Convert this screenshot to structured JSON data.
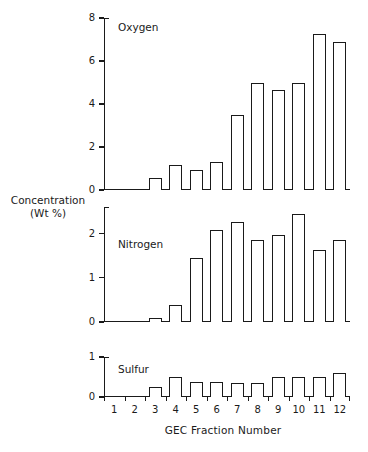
{
  "chart_data": {
    "type": "bar",
    "title": "",
    "xlabel": "GEC Fraction Number",
    "ylabel": "Concentration (Wt %)",
    "ylabel_lines": [
      "Concentration",
      "(Wt %)"
    ],
    "categories": [
      "1",
      "2",
      "3",
      "4",
      "5",
      "6",
      "7",
      "8",
      "9",
      "10",
      "11",
      "12"
    ],
    "grid": false,
    "legend": "none",
    "panels": [
      {
        "name": "oxygen",
        "label": "Oxygen",
        "ylim": [
          0,
          8
        ],
        "yticks": [
          0,
          2,
          4,
          6,
          8
        ],
        "ytick_labels": [
          "0",
          "2",
          "4",
          "6",
          "8"
        ],
        "values": [
          0,
          0,
          0.55,
          1.15,
          0.95,
          1.3,
          3.5,
          5.0,
          4.65,
          5.0,
          7.25,
          6.9
        ]
      },
      {
        "name": "nitrogen",
        "label": "Nitrogen",
        "ylim": [
          0,
          2.6
        ],
        "yticks": [
          0,
          1,
          2
        ],
        "ytick_labels": [
          "0",
          "1",
          "2"
        ],
        "values": [
          0,
          0,
          0.08,
          0.38,
          1.45,
          2.07,
          2.27,
          1.85,
          1.97,
          2.45,
          1.62,
          1.85
        ]
      },
      {
        "name": "sulfur",
        "label": "Sulfur",
        "ylim": [
          0,
          1
        ],
        "yticks": [
          0,
          1
        ],
        "ytick_labels": [
          "0",
          "1"
        ],
        "values": [
          0,
          0,
          0.25,
          0.5,
          0.37,
          0.37,
          0.36,
          0.35,
          0.5,
          0.5,
          0.49,
          0.6
        ]
      }
    ]
  },
  "colors": {
    "ink": "#1a1a1a",
    "background": "#ffffff",
    "bar_fill": "#ffffff"
  }
}
